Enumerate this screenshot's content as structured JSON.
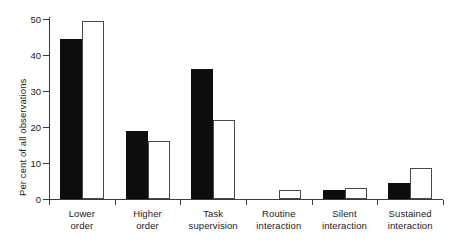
{
  "chart_data": {
    "type": "bar",
    "title": "",
    "xlabel": "",
    "ylabel": "Per cent of all observations",
    "ylim": [
      0,
      50
    ],
    "yticks": [
      0,
      10,
      20,
      30,
      40,
      50
    ],
    "ytick_labels": [
      "0",
      "10",
      "20",
      "30",
      "40",
      "50"
    ],
    "grid": false,
    "legend": "none",
    "categories": [
      "Lower order",
      "Higher order",
      "Task supervision",
      "Routine interaction",
      "Silent interaction",
      "Sustained interaction"
    ],
    "category_lines": [
      [
        "Lower",
        "order"
      ],
      [
        "Higher",
        "order"
      ],
      [
        "Task",
        "supervision"
      ],
      [
        "Routine",
        "interaction"
      ],
      [
        "Silent",
        "interaction"
      ],
      [
        "Sustained",
        "interaction"
      ]
    ],
    "series": [
      {
        "name": "black",
        "style": "filled",
        "color": "#0d0d0d",
        "values": [
          44.5,
          19.0,
          36.0,
          0.0,
          2.5,
          4.5
        ]
      },
      {
        "name": "white",
        "style": "hollow",
        "color": "#ffffff",
        "values": [
          49.5,
          16.0,
          22.0,
          2.5,
          3.0,
          8.5
        ]
      }
    ]
  },
  "axis": {
    "line_color": "#3b3b3b"
  }
}
